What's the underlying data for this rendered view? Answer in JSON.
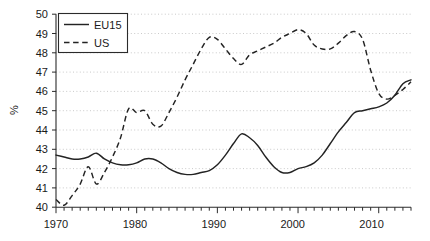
{
  "chart_data": {
    "type": "line",
    "title": "",
    "subtitle": "",
    "xlabel": "",
    "ylabel": "%",
    "xlim": [
      1970,
      2014
    ],
    "ylim": [
      40,
      50
    ],
    "grid": true,
    "grid_axis": "y",
    "legend_position": "top-left",
    "x": [
      1970,
      1971,
      1972,
      1973,
      1974,
      1975,
      1976,
      1977,
      1978,
      1979,
      1980,
      1981,
      1982,
      1983,
      1984,
      1985,
      1986,
      1987,
      1988,
      1989,
      1990,
      1991,
      1992,
      1993,
      1994,
      1995,
      1996,
      1997,
      1998,
      1999,
      2000,
      2001,
      2002,
      2003,
      2004,
      2005,
      2006,
      2007,
      2008,
      2009,
      2010,
      2011,
      2012,
      2013,
      2014
    ],
    "y_tick_labels": [
      "40",
      "41",
      "42",
      "43",
      "44",
      "45",
      "46",
      "47",
      "48",
      "49",
      "50"
    ],
    "y_ticks": [
      40,
      41,
      42,
      43,
      44,
      45,
      46,
      47,
      48,
      49,
      50
    ],
    "x_tick_labels": [
      "1970",
      "1980",
      "1990",
      "2000",
      "2010"
    ],
    "x_major_ticks": [
      1970,
      1980,
      1990,
      2000,
      2010
    ],
    "x_minor_tick_interval": 1,
    "series": [
      {
        "name": "EU15",
        "style": "solid",
        "color": "#232323",
        "values": [
          42.7,
          42.6,
          42.5,
          42.5,
          42.6,
          42.8,
          42.5,
          42.3,
          42.2,
          42.2,
          42.3,
          42.5,
          42.5,
          42.3,
          42.0,
          41.8,
          41.7,
          41.7,
          41.8,
          41.9,
          42.2,
          42.7,
          43.3,
          43.8,
          43.6,
          43.2,
          42.6,
          42.1,
          41.8,
          41.8,
          42.0,
          42.1,
          42.3,
          42.7,
          43.3,
          43.9,
          44.4,
          44.9,
          45.0,
          45.1,
          45.2,
          45.4,
          45.8,
          46.4,
          46.6
        ]
      },
      {
        "name": "US",
        "style": "dashed",
        "color": "#232323",
        "values": [
          40.4,
          40.1,
          40.6,
          41.2,
          42.1,
          41.2,
          41.8,
          42.6,
          43.6,
          45.1,
          44.9,
          45.0,
          44.3,
          44.2,
          44.9,
          45.7,
          46.6,
          47.4,
          48.2,
          48.8,
          48.7,
          48.2,
          47.7,
          47.4,
          47.9,
          48.1,
          48.3,
          48.5,
          48.8,
          49.0,
          49.2,
          49.0,
          48.4,
          48.2,
          48.2,
          48.5,
          48.9,
          49.1,
          48.7,
          47.1,
          45.9,
          45.6,
          45.8,
          46.1,
          46.5
        ]
      }
    ],
    "series_note": "values are EU15 then US, aligned to x 1970..2014"
  },
  "legend": {
    "entries": [
      {
        "label": "EU15",
        "style": "solid"
      },
      {
        "label": "US",
        "style": "dashed"
      }
    ]
  },
  "axes": {
    "y_axis_label": "%",
    "y_tick_0": "40",
    "y_tick_1": "41",
    "y_tick_2": "42",
    "y_tick_3": "43",
    "y_tick_4": "44",
    "y_tick_5": "45",
    "y_tick_6": "46",
    "y_tick_7": "47",
    "y_tick_8": "48",
    "y_tick_9": "49",
    "y_tick_10": "50",
    "x_tick_0": "1970",
    "x_tick_1": "1980",
    "x_tick_2": "1990",
    "x_tick_3": "2000",
    "x_tick_4": "2010"
  }
}
